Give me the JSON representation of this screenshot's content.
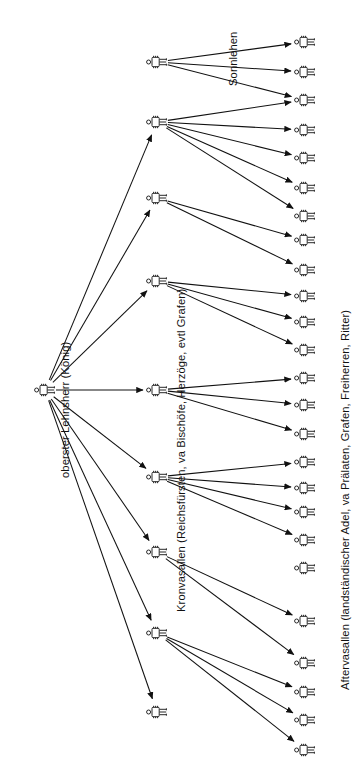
{
  "diagram": {
    "orientation": "rotated-90-ccw",
    "background": "#ffffff",
    "line_color": "#111111",
    "icon_name": "person-icon",
    "labels": {
      "root": "oberster Lehnsherr (König)",
      "level2": "Kronvasallen (Reichsfürsten, va Bischöfe, Herzöge, evtl Grafen)",
      "level3": "Aftervasallen (landständischer Adel, va Prälaten, Grafen, Freiherren, Ritter)",
      "sublease": "Sonnlehen"
    },
    "levels": [
      {
        "id": "level1",
        "name": "oberster Lehnsherr",
        "count": 1
      },
      {
        "id": "level2",
        "name": "Kronvasallen",
        "count": 8
      },
      {
        "id": "level3",
        "name": "Aftervasallen",
        "count": 24
      },
      {
        "id": "level4",
        "name": "Sonnlehen",
        "count": 3
      }
    ],
    "nodes": {
      "root": {
        "id": "king",
        "x": 45,
        "y": 390
      },
      "level2": [
        {
          "id": "v1",
          "x": 157,
          "y": 62
        },
        {
          "id": "v2",
          "x": 157,
          "y": 122
        },
        {
          "id": "v3",
          "x": 157,
          "y": 198
        },
        {
          "id": "v4",
          "x": 157,
          "y": 281
        },
        {
          "id": "v5",
          "x": 157,
          "y": 390
        },
        {
          "id": "v6",
          "x": 157,
          "y": 477
        },
        {
          "id": "v7",
          "x": 157,
          "y": 552
        },
        {
          "id": "v8",
          "x": 157,
          "y": 633
        },
        {
          "id": "v9",
          "x": 157,
          "y": 712
        }
      ],
      "level3": [
        {
          "id": "a1",
          "x": 305,
          "y": 42
        },
        {
          "id": "a2",
          "x": 305,
          "y": 72
        },
        {
          "id": "a3",
          "x": 305,
          "y": 100
        },
        {
          "id": "a4",
          "x": 305,
          "y": 130
        },
        {
          "id": "a5",
          "x": 305,
          "y": 158
        },
        {
          "id": "a6",
          "x": 305,
          "y": 188
        },
        {
          "id": "a7",
          "x": 305,
          "y": 216
        },
        {
          "id": "a8",
          "x": 305,
          "y": 240
        },
        {
          "id": "a9",
          "x": 305,
          "y": 270
        },
        {
          "id": "a10",
          "x": 305,
          "y": 296
        },
        {
          "id": "a11",
          "x": 305,
          "y": 322
        },
        {
          "id": "a12",
          "x": 305,
          "y": 350
        },
        {
          "id": "a13",
          "x": 305,
          "y": 378
        },
        {
          "id": "a14",
          "x": 305,
          "y": 405
        },
        {
          "id": "a15",
          "x": 305,
          "y": 434
        },
        {
          "id": "a16",
          "x": 305,
          "y": 462
        },
        {
          "id": "a17",
          "x": 305,
          "y": 488
        },
        {
          "id": "a18",
          "x": 305,
          "y": 512
        },
        {
          "id": "a19",
          "x": 305,
          "y": 540
        },
        {
          "id": "a20",
          "x": 305,
          "y": 568
        },
        {
          "id": "a21",
          "x": 305,
          "y": 621
        },
        {
          "id": "a22",
          "x": 305,
          "y": 663
        },
        {
          "id": "a23",
          "x": 305,
          "y": 692
        },
        {
          "id": "a24",
          "x": 305,
          "y": 720
        },
        {
          "id": "a25",
          "x": 305,
          "y": 750
        }
      ],
      "level4": [
        {
          "id": "s1",
          "x": 305,
          "y": 42
        },
        {
          "id": "s2",
          "x": 305,
          "y": 72
        },
        {
          "id": "s3",
          "x": 305,
          "y": 100
        }
      ],
      "sublease_source": {
        "id": "sl",
        "x": 157,
        "y": 62
      }
    },
    "edges": {
      "from_king": [
        "v2",
        "v3",
        "v4",
        "v5",
        "v6",
        "v7",
        "v8",
        "v9"
      ],
      "from_v2": [
        "a3",
        "a4",
        "a5",
        "a6",
        "a7"
      ],
      "from_v3": [
        "a8",
        "a9"
      ],
      "from_v4": [
        "a10",
        "a11",
        "a12"
      ],
      "from_v5": [
        "a13",
        "a14",
        "a15"
      ],
      "from_v6": [
        "a16",
        "a17",
        "a18",
        "a19"
      ],
      "from_v7": [
        "a21",
        "a22"
      ],
      "from_v8": [
        "a23",
        "a24",
        "a25"
      ],
      "from_sublease": [
        "s1",
        "s2",
        "s3"
      ]
    }
  }
}
